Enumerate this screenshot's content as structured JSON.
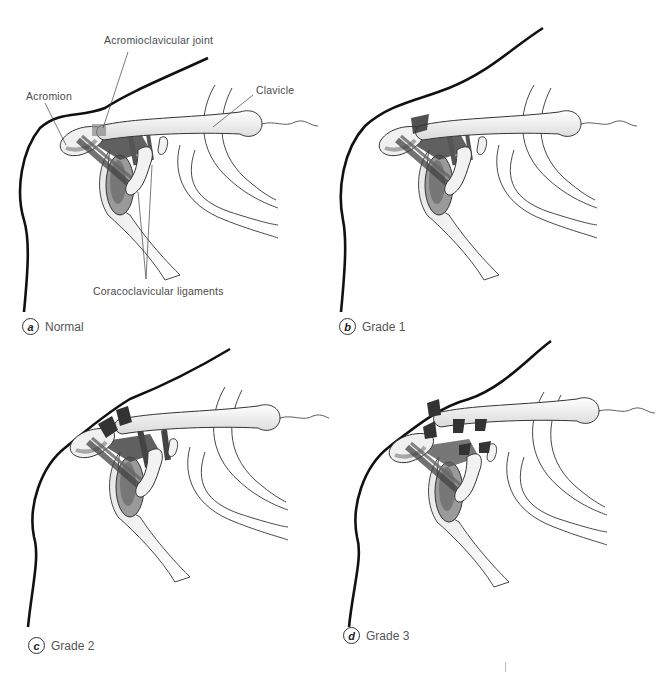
{
  "figure": {
    "panels": [
      {
        "letter": "a",
        "caption": "Normal"
      },
      {
        "letter": "b",
        "caption": "Grade 1"
      },
      {
        "letter": "c",
        "caption": "Grade 2"
      },
      {
        "letter": "d",
        "caption": "Grade 3"
      }
    ],
    "labels": {
      "acromioclavicular_joint": "Acromioclavicular joint",
      "acromion": "Acromion",
      "clavicle": "Clavicle",
      "coracoclavicular_ligaments": "Coracoclavicular ligaments"
    }
  },
  "colors": {
    "outline": "#111111",
    "bone_fill": "#f3f3f3",
    "shadow": "#8a8a8a",
    "ligament": "#555555",
    "text": "#4a4a4a"
  }
}
